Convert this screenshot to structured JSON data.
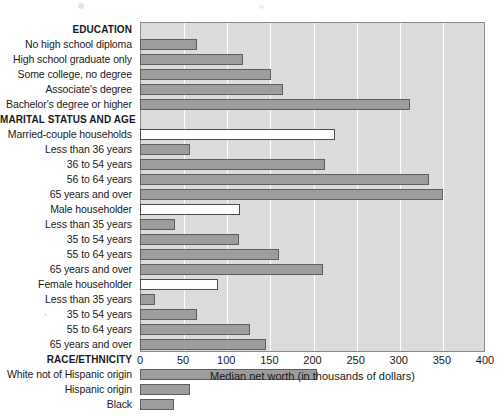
{
  "chart_data": {
    "type": "bar",
    "orientation": "horizontal",
    "title": "",
    "xlabel": "Median net worth (in thousands of dollars)",
    "ylabel": "",
    "xlim": [
      0,
      400
    ],
    "xticks": [
      0,
      50,
      100,
      150,
      200,
      250,
      300,
      350,
      400
    ],
    "grid": "vertical-white",
    "legend": "none",
    "categories": [
      "EDUCATION",
      "No high school diploma",
      "High school graduate only",
      "Some college, no degree",
      "Associate's degree",
      "Bachelor's degree or higher",
      "MARITAL STATUS AND AGE",
      "Married-couple households",
      "Less than 36 years",
      "36 to 54 years",
      "56 to 64 years",
      "65 years and over",
      "Male householder",
      "Less than 35 years",
      "35 to 54 years",
      "55 to 64 years",
      "65 years and over",
      "Female householder",
      "Less than 35 years",
      "35 to 54 years",
      "55 to 64 years",
      "65 years and over",
      "RACE/ETHNICITY",
      "White not of Hispanic origin",
      "Hispanic origin",
      "Black"
    ],
    "values": [
      null,
      66,
      119,
      152,
      166,
      313,
      null,
      226,
      58,
      215,
      335,
      351,
      116,
      41,
      115,
      161,
      212,
      90,
      17,
      66,
      127,
      146,
      null,
      205,
      58,
      39
    ],
    "row_kinds": [
      "section",
      "bar",
      "bar",
      "bar",
      "bar",
      "bar",
      "section",
      "bar-white",
      "bar",
      "bar",
      "bar",
      "bar",
      "bar-white",
      "bar",
      "bar",
      "bar",
      "bar",
      "bar-white",
      "bar",
      "bar",
      "bar",
      "bar",
      "section",
      "bar",
      "bar",
      "bar"
    ],
    "colors": {
      "bar_fill": "#9d9d9d",
      "bar_border": "#5d5d5d",
      "bar_fill_highlight": "#fdfdfd",
      "plot_background": "#dcdcdc",
      "gridline": "#ffffff",
      "axis": "#8a8a8a",
      "text": "#1a1a1a"
    }
  }
}
